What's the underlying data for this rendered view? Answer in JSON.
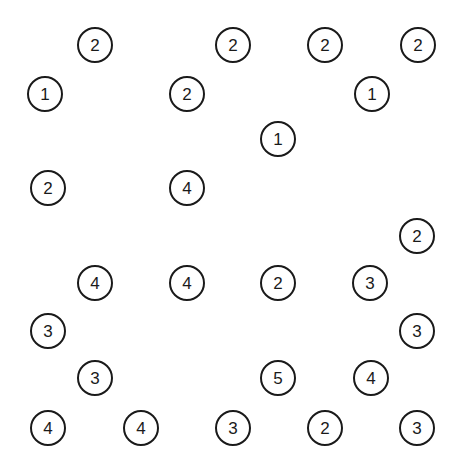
{
  "figure": {
    "width": 462,
    "height": 471,
    "background_color": "#ffffff",
    "node_fill_color": "#ffffff",
    "node_stroke_color": "#1a1a1a",
    "node_stroke_width": 2,
    "node_diameter": 36,
    "label_color": "#1a1a1a",
    "label_font_size": 17
  },
  "chart_data": {
    "type": "scatter",
    "xlabel": "",
    "ylabel": "",
    "xlim": [
      0,
      462
    ],
    "ylim": [
      0,
      471
    ],
    "grid": false,
    "legend": "none",
    "marker": "circle-outline-with-number-label",
    "value_range": [
      1,
      5
    ],
    "count": 27,
    "points": [
      {
        "id": "n1",
        "label": "2",
        "value": 2,
        "x": 95,
        "y": 45
      },
      {
        "id": "n2",
        "label": "2",
        "value": 2,
        "x": 233,
        "y": 45
      },
      {
        "id": "n3",
        "label": "2",
        "value": 2,
        "x": 325,
        "y": 45
      },
      {
        "id": "n4",
        "label": "2",
        "value": 2,
        "x": 418,
        "y": 45
      },
      {
        "id": "n5",
        "label": "1",
        "value": 1,
        "x": 45,
        "y": 94
      },
      {
        "id": "n6",
        "label": "2",
        "value": 2,
        "x": 187,
        "y": 94
      },
      {
        "id": "n7",
        "label": "1",
        "value": 1,
        "x": 372,
        "y": 94
      },
      {
        "id": "n8",
        "label": "1",
        "value": 1,
        "x": 278,
        "y": 139
      },
      {
        "id": "n9",
        "label": "2",
        "value": 2,
        "x": 48,
        "y": 188
      },
      {
        "id": "n10",
        "label": "4",
        "value": 4,
        "x": 187,
        "y": 188
      },
      {
        "id": "n11",
        "label": "2",
        "value": 2,
        "x": 417,
        "y": 236
      },
      {
        "id": "n12",
        "label": "4",
        "value": 4,
        "x": 95,
        "y": 283
      },
      {
        "id": "n13",
        "label": "4",
        "value": 4,
        "x": 187,
        "y": 283
      },
      {
        "id": "n14",
        "label": "2",
        "value": 2,
        "x": 278,
        "y": 283
      },
      {
        "id": "n15",
        "label": "3",
        "value": 3,
        "x": 370,
        "y": 283
      },
      {
        "id": "n16",
        "label": "3",
        "value": 3,
        "x": 48,
        "y": 331
      },
      {
        "id": "n17",
        "label": "3",
        "value": 3,
        "x": 417,
        "y": 331
      },
      {
        "id": "n18",
        "label": "3",
        "value": 3,
        "x": 95,
        "y": 378
      },
      {
        "id": "n19",
        "label": "5",
        "value": 5,
        "x": 278,
        "y": 378
      },
      {
        "id": "n20",
        "label": "4",
        "value": 4,
        "x": 371,
        "y": 378
      },
      {
        "id": "n21",
        "label": "4",
        "value": 4,
        "x": 48,
        "y": 428
      },
      {
        "id": "n22",
        "label": "4",
        "value": 4,
        "x": 141,
        "y": 428
      },
      {
        "id": "n23",
        "label": "3",
        "value": 3,
        "x": 233,
        "y": 428
      },
      {
        "id": "n24",
        "label": "2",
        "value": 2,
        "x": 325,
        "y": 428
      },
      {
        "id": "n25",
        "label": "3",
        "value": 3,
        "x": 417,
        "y": 428
      }
    ]
  }
}
